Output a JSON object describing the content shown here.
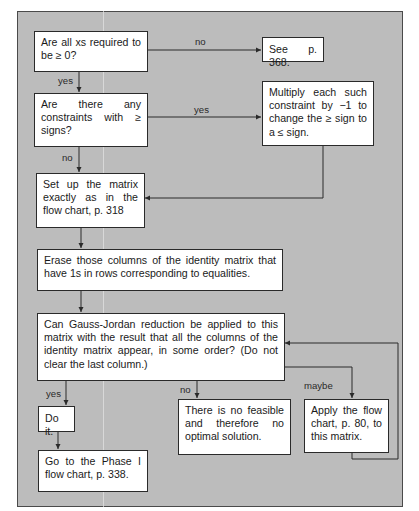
{
  "diagram": {
    "type": "flowchart",
    "colors": {
      "background": "#bcbcbc",
      "box": "#ffffff",
      "line": "#2a2a2a"
    },
    "nodes": {
      "q_nonneg": "Are all xs required to be ≥ 0?",
      "see_368": "See p. 368.",
      "q_geq": "Are there any constraints with ≥ signs?",
      "multiply": "Multiply each such constraint by −1 to change the ≥ sign to a ≤ sign.",
      "setup": "Set up the matrix exactly as in the flow chart, p. 318",
      "erase": "Erase those columns of the identity matrix that have 1s in rows corresponding to equalities.",
      "q_gauss": "Can Gauss-Jordan reduction be applied to this matrix with the result that all the columns of the identity matrix appear, in some order? (Do not clear the last column.)",
      "do_it": "Do it.",
      "no_feasible": "There is no feasible and therefore no optimal solution.",
      "apply_80": "Apply the flow chart, p. 80, to this matrix.",
      "phase1": "Go to the Phase I flow chart, p. 338."
    },
    "edge_labels": {
      "nonneg_no": "no",
      "nonneg_yes": "yes",
      "geq_yes": "yes",
      "geq_no": "no",
      "gauss_yes": "yes",
      "gauss_no": "no",
      "gauss_maybe": "maybe"
    },
    "edges": [
      {
        "from": "q_nonneg",
        "to": "see_368",
        "label": "no"
      },
      {
        "from": "q_nonneg",
        "to": "q_geq",
        "label": "yes"
      },
      {
        "from": "q_geq",
        "to": "multiply",
        "label": "yes"
      },
      {
        "from": "q_geq",
        "to": "setup",
        "label": "no"
      },
      {
        "from": "multiply",
        "to": "setup",
        "label": ""
      },
      {
        "from": "setup",
        "to": "erase",
        "label": ""
      },
      {
        "from": "erase",
        "to": "q_gauss",
        "label": ""
      },
      {
        "from": "q_gauss",
        "to": "do_it",
        "label": "yes"
      },
      {
        "from": "q_gauss",
        "to": "no_feasible",
        "label": "no"
      },
      {
        "from": "q_gauss",
        "to": "apply_80",
        "label": "maybe"
      },
      {
        "from": "apply_80",
        "to": "q_gauss",
        "label": ""
      },
      {
        "from": "do_it",
        "to": "phase1",
        "label": ""
      }
    ]
  }
}
